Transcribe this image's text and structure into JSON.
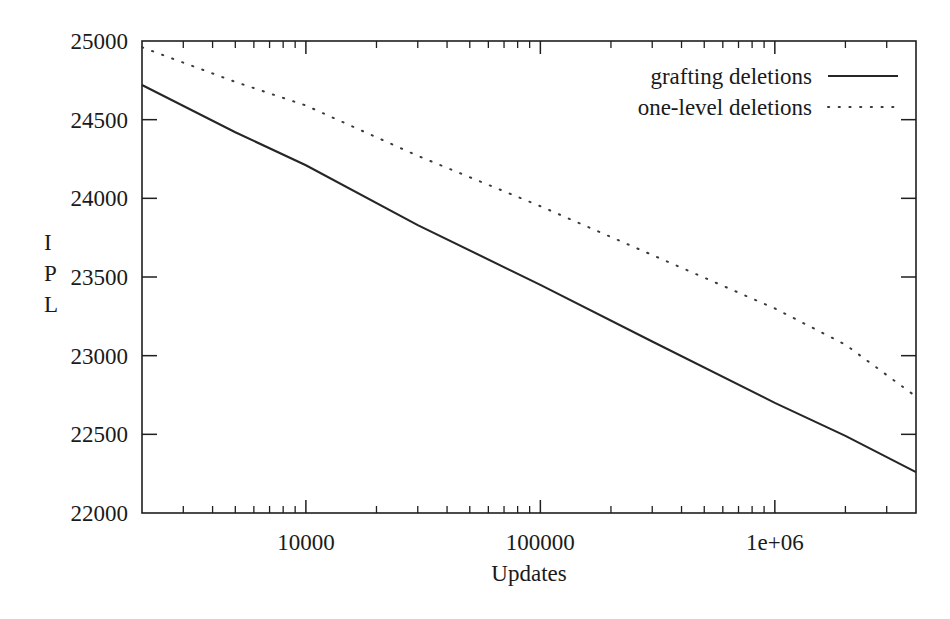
{
  "chart_data": {
    "type": "line",
    "title": "",
    "xlabel": "Updates",
    "ylabel": "IPL",
    "xscale": "log",
    "yscale": "linear",
    "xlim": [
      2000,
      4000000
    ],
    "ylim": [
      22000,
      25000
    ],
    "grid": false,
    "legend_position": "top-right",
    "xticks": [
      {
        "value": 10000,
        "label": "10000"
      },
      {
        "value": 100000,
        "label": "100000"
      },
      {
        "value": 1000000,
        "label": "1e+06"
      }
    ],
    "yticks": [
      {
        "value": 22000,
        "label": "22000"
      },
      {
        "value": 22500,
        "label": "22500"
      },
      {
        "value": 23000,
        "label": "23000"
      },
      {
        "value": 23500,
        "label": "23500"
      },
      {
        "value": 24000,
        "label": "24000"
      },
      {
        "value": 24500,
        "label": "24500"
      },
      {
        "value": 25000,
        "label": "25000"
      }
    ],
    "series": [
      {
        "name": "grafting deletions",
        "style": "solid",
        "color": "#262626",
        "x": [
          2000,
          5000,
          10000,
          30000,
          100000,
          300000,
          1000000,
          2000000,
          4000000
        ],
        "y": [
          24720,
          24420,
          24210,
          23830,
          23450,
          23090,
          22700,
          22490,
          22260
        ]
      },
      {
        "name": "one-level deletions",
        "style": "dotted",
        "color": "#3a3a3a",
        "x": [
          2000,
          5000,
          10000,
          30000,
          100000,
          300000,
          1000000,
          2000000,
          4000000
        ],
        "y": [
          24960,
          24740,
          24590,
          24270,
          23950,
          23640,
          23300,
          23070,
          22740
        ]
      }
    ]
  },
  "ylabel_chars": [
    "I",
    "P",
    "L"
  ],
  "legend": {
    "entries": [
      {
        "label": "grafting deletions",
        "style": "solid"
      },
      {
        "label": "one-level deletions",
        "style": "dotted"
      }
    ]
  },
  "axis": {
    "x_title": "Updates"
  }
}
